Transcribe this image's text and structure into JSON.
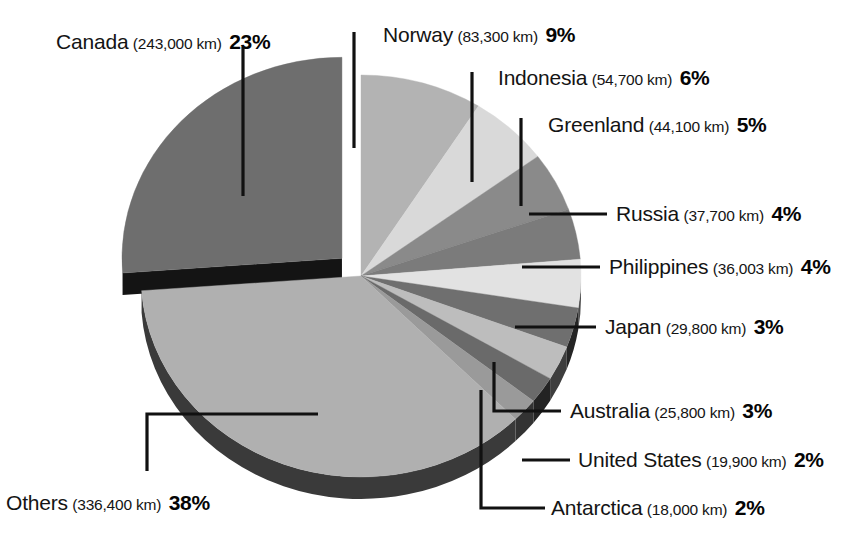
{
  "title_partial": "Coastlines of the world — longest coastlines",
  "units_note": "km",
  "chart_data": {
    "type": "pie",
    "title": "",
    "legend_position": "callout-labels",
    "value_unit": "km",
    "total_value": 928703,
    "categories": [
      "Canada",
      "Norway",
      "Indonesia",
      "Greenland",
      "Russia",
      "Philippines",
      "Japan",
      "Australia",
      "United States",
      "Antarctica",
      "Others"
    ],
    "values": [
      243000,
      83300,
      54700,
      44100,
      37700,
      36003,
      29800,
      25800,
      19900,
      18000,
      336400
    ],
    "percents": [
      23,
      9,
      6,
      5,
      4,
      4,
      3,
      3,
      2,
      2,
      38
    ],
    "value_labels": [
      "243,000 km",
      "83,300 km",
      "54,700 km",
      "44,100 km",
      "37,700 km",
      "36,003 km",
      "29,800 km",
      "25,800 km",
      "19,900 km",
      "18,000 km",
      "336,400 km"
    ],
    "percent_labels": [
      "23%",
      "9%",
      "6%",
      "5%",
      "4%",
      "4%",
      "3%",
      "3%",
      "2%",
      "2%",
      "38%"
    ],
    "colors": [
      "#6e6e6e",
      "#b3b3b3",
      "#d9d9d9",
      "#8a8a8a",
      "#7b7b7b",
      "#e2e2e2",
      "#6f6f6f",
      "#bdbdbd",
      "#6a6a6a",
      "#9a9a9a",
      "#b0b0b0"
    ],
    "exploded": [
      "Canada"
    ],
    "grid": false,
    "three_d": true
  },
  "slices": [
    {
      "name": "Canada",
      "value_label": "(243,000 km)",
      "pct": "23%"
    },
    {
      "name": "Norway",
      "value_label": "(83,300 km)",
      "pct": "9%"
    },
    {
      "name": "Indonesia",
      "value_label": "(54,700 km)",
      "pct": "6%"
    },
    {
      "name": "Greenland",
      "value_label": "(44,100 km)",
      "pct": "5%"
    },
    {
      "name": "Russia",
      "value_label": "(37,700 km)",
      "pct": "4%"
    },
    {
      "name": "Philippines",
      "value_label": "(36,003 km)",
      "pct": "4%"
    },
    {
      "name": "Japan",
      "value_label": "(29,800 km)",
      "pct": "3%"
    },
    {
      "name": "Australia",
      "value_label": "(25,800 km)",
      "pct": "3%"
    },
    {
      "name": "United States",
      "value_label": "(19,900 km)",
      "pct": "2%"
    },
    {
      "name": "Antarctica",
      "value_label": "(18,000 km)",
      "pct": "2%"
    },
    {
      "name": "Others",
      "value_label": "(336,400 km)",
      "pct": "38%"
    }
  ]
}
